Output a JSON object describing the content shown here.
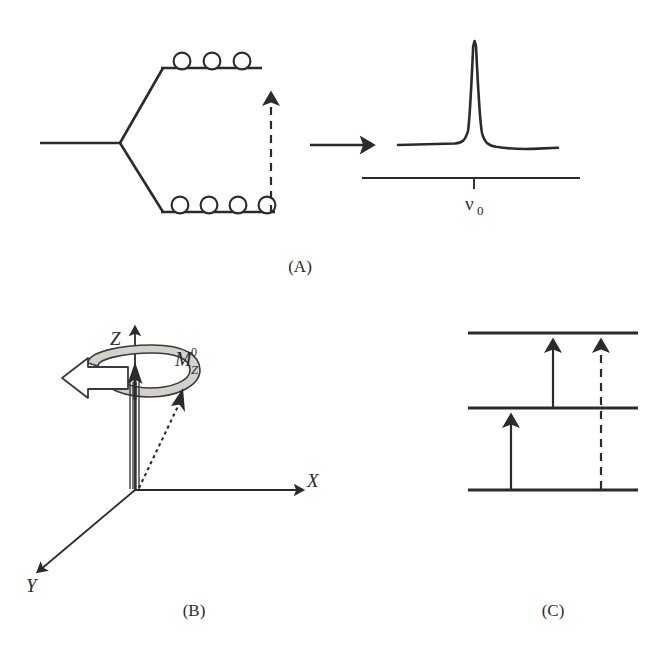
{
  "figure": {
    "panels": [
      {
        "id": "A",
        "caption": "(A)",
        "description": "Zeeman energy level splitting with spin populations and resulting NMR spectrum"
      },
      {
        "id": "B",
        "caption": "(B)",
        "description": "Vector model of net magnetization precessing about the Z axis"
      },
      {
        "id": "C",
        "caption": "(C)",
        "description": "Three-level energy diagram with single-quantum and double-quantum transitions"
      }
    ]
  },
  "panel_a": {
    "upper_level_spin_count": 3,
    "lower_level_spin_count": 4,
    "transition_arrow": "dashed-up-arrow",
    "flow_arrow": "solid-right-arrow",
    "spectrum": {
      "peak_label_main": "ν",
      "peak_label_sub": "0",
      "peak_label": "ν0",
      "baseline": "frequency-axis",
      "tick": "nu-zero-tick"
    }
  },
  "panel_b": {
    "axes": [
      {
        "name": "Z",
        "label": "Z"
      },
      {
        "name": "X",
        "label": "X"
      },
      {
        "name": "Y",
        "label": "Y"
      }
    ],
    "magnetization": {
      "label_main": "M",
      "label_sub": "Z",
      "label_sup": "0",
      "label": "MZ0"
    },
    "precession_ribbon": "gray-ribbon",
    "precession_arrow": "hollow-left-arrow",
    "spin_bundle": "parallel-spin-lines",
    "individual_spin_vector": "dotted-arrow"
  },
  "panel_c": {
    "levels": [
      {
        "name": "upper-level"
      },
      {
        "name": "middle-level"
      },
      {
        "name": "lower-level"
      }
    ],
    "transitions": [
      {
        "name": "lower-to-middle",
        "style": "solid"
      },
      {
        "name": "middle-to-upper",
        "style": "solid"
      },
      {
        "name": "lower-to-upper",
        "style": "dashed"
      }
    ]
  },
  "colors": {
    "ink": "#2b2b2b",
    "ribbon_fill": "#d4d1cd",
    "ribbon_stroke": "#3a3a3a",
    "background": "#ffffff"
  }
}
